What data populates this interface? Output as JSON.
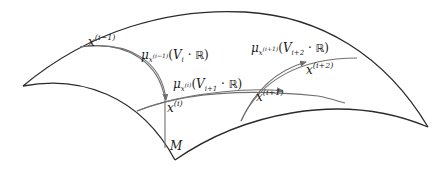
{
  "diagram": {
    "manifold_label": "M",
    "points": {
      "x_i_minus_1": {
        "base": "x",
        "sup": "(i−1)"
      },
      "x_i": {
        "base": "x",
        "sup": "(i)"
      },
      "x_i_plus_1": {
        "base": "x",
        "sup": "(i+1)"
      },
      "x_i_plus_2": {
        "base": "x",
        "sup": "(i+2)"
      }
    },
    "geodesics": [
      {
        "mu": "μ",
        "sub_base": "x",
        "sub_sup": "(i−1)",
        "open": "(",
        "V": "V",
        "V_sub": "i",
        "dot": " · ",
        "R": "ℝ",
        "close": ")"
      },
      {
        "mu": "μ",
        "sub_base": "x",
        "sub_sup": "(i)",
        "open": "(",
        "V": "V",
        "V_sub": "i+1",
        "dot": " · ",
        "R": "ℝ",
        "close": ")"
      },
      {
        "mu": "μ",
        "sub_base": "x",
        "sub_sup": "(i+1)",
        "open": "(",
        "V": "V",
        "V_sub": "i+2",
        "dot": " · ",
        "R": "ℝ",
        "close": ")"
      }
    ],
    "colors": {
      "edge": "#2a2a2a",
      "geodesic": "#707070",
      "text": "#1a1a1a",
      "background": "#ffffff"
    }
  }
}
